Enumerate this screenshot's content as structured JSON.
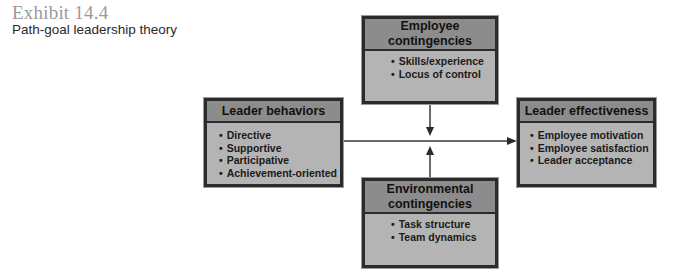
{
  "exhibit": {
    "number": "Exhibit 14.4",
    "title": "Path-goal leadership theory"
  },
  "boxes": {
    "employee": {
      "title": "Employee contingencies",
      "items": [
        "Skills/experience",
        "Locus of control"
      ]
    },
    "leader_behaviors": {
      "title": "Leader behaviors",
      "items": [
        "Directive",
        "Supportive",
        "Participative",
        "Achievement-oriented"
      ]
    },
    "leader_effectiveness": {
      "title": "Leader effectiveness",
      "items": [
        "Employee motivation",
        "Employee satisfaction",
        "Leader acceptance"
      ]
    },
    "environmental": {
      "title": "Environmental contingencies",
      "items": [
        "Task structure",
        "Team dynamics"
      ]
    }
  },
  "colors": {
    "header_fill": "#8c8c8c",
    "body_fill": "#b4b4b4",
    "border": "#2b2b2b",
    "arrow": "#3a3a3a"
  }
}
